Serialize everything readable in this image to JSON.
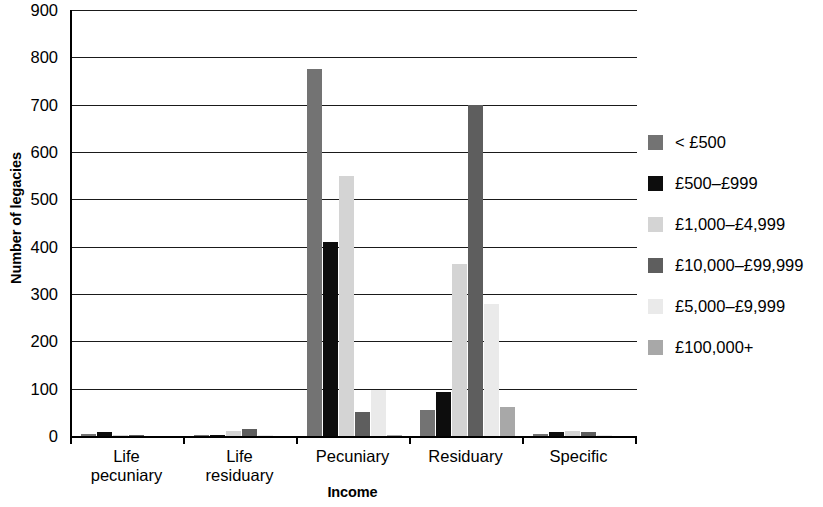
{
  "chart_data": {
    "type": "bar",
    "title": "",
    "xlabel": "Income",
    "ylabel": "Number of legacies",
    "ylim": [
      0,
      900
    ],
    "ytick_step": 100,
    "yticks": [
      "900",
      "800",
      "700",
      "600",
      "500",
      "400",
      "300",
      "200",
      "100",
      "0"
    ],
    "grid": true,
    "legend_position": "right",
    "categories": [
      "Life\npecuniary",
      "Life\nresiduary",
      "Pecuniary",
      "Residuary",
      "Specific"
    ],
    "series": [
      {
        "name": "< £500",
        "color": "#737373",
        "values": [
          5,
          3,
          775,
          55,
          5
        ]
      },
      {
        "name": "£500–£999",
        "color": "#0d0d0d",
        "values": [
          8,
          3,
          410,
          92,
          8
        ]
      },
      {
        "name": "£1,000–£4,999",
        "color": "#d4d4d4",
        "values": [
          3,
          10,
          550,
          363,
          10
        ]
      },
      {
        "name": "£10,000–£99,999",
        "color": "#5e5e5e",
        "values": [
          2,
          14,
          50,
          700,
          9
        ]
      },
      {
        "name": "£5,000–£9,999",
        "color": "#eaeaea",
        "values": [
          0,
          2,
          98,
          278,
          3
        ]
      },
      {
        "name": "£100,000+",
        "color": "#a8a8a8",
        "values": [
          0,
          0,
          2,
          62,
          0
        ]
      }
    ]
  },
  "legend": {
    "items": [
      {
        "label": "< £500",
        "color": "#737373"
      },
      {
        "label": "£500–£999",
        "color": "#0d0d0d"
      },
      {
        "label": "£1,000–£4,999",
        "color": "#d4d4d4"
      },
      {
        "label": "£10,000–£99,999",
        "color": "#5e5e5e"
      },
      {
        "label": "£5,000–£9,999",
        "color": "#eaeaea"
      },
      {
        "label": "£100,000+",
        "color": "#a8a8a8"
      }
    ]
  },
  "axes": {
    "y_title": "Number of legacies",
    "x_title": "Income"
  },
  "colors": {
    "axis": "#000000",
    "gridline": "#1a1a1a",
    "background": "#ffffff"
  }
}
